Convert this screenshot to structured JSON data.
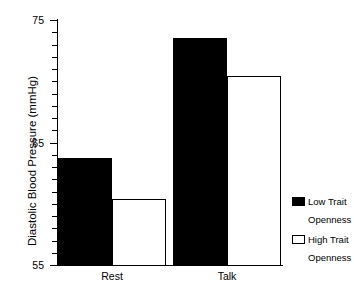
{
  "chart_data": {
    "type": "bar",
    "title": "",
    "xlabel": "",
    "ylabel": "Diastolic Blood Pressure (mmHg)",
    "categories": [
      "Rest",
      "Talk"
    ],
    "series": [
      {
        "name": "Low Trait Openness",
        "values": [
          63.7,
          73.5
        ],
        "color": "#000000"
      },
      {
        "name": "High Trait Openness",
        "values": [
          60.4,
          70.4
        ],
        "color": "#ffffff"
      }
    ],
    "ylim": [
      55,
      75
    ],
    "yticks": [
      55,
      65,
      75
    ],
    "ytick_labels": [
      "55",
      "65",
      "75"
    ],
    "yminor_interval": 1,
    "grid": false,
    "legend_position": "right"
  },
  "axes": {
    "y_title": "Diastolic Blood Pressure (mmHg)",
    "y_ticks": [
      {
        "value": 75,
        "label": "75",
        "major": true
      },
      {
        "value": 74,
        "label": "",
        "major": false
      },
      {
        "value": 73,
        "label": "",
        "major": false
      },
      {
        "value": 72,
        "label": "",
        "major": false
      },
      {
        "value": 71,
        "label": "",
        "major": false
      },
      {
        "value": 70,
        "label": "",
        "major": false
      },
      {
        "value": 69,
        "label": "",
        "major": false
      },
      {
        "value": 68,
        "label": "",
        "major": false
      },
      {
        "value": 67,
        "label": "",
        "major": false
      },
      {
        "value": 66,
        "label": "",
        "major": false
      },
      {
        "value": 65,
        "label": "65",
        "major": true
      },
      {
        "value": 64,
        "label": "",
        "major": false
      },
      {
        "value": 63,
        "label": "",
        "major": false
      },
      {
        "value": 62,
        "label": "",
        "major": false
      },
      {
        "value": 61,
        "label": "",
        "major": false
      },
      {
        "value": 60,
        "label": "",
        "major": false
      },
      {
        "value": 59,
        "label": "",
        "major": false
      },
      {
        "value": 58,
        "label": "",
        "major": false
      },
      {
        "value": 57,
        "label": "",
        "major": false
      },
      {
        "value": 56,
        "label": "",
        "major": false
      },
      {
        "value": 55,
        "label": "55",
        "major": true
      }
    ],
    "x_labels": [
      "Rest",
      "Talk"
    ]
  },
  "legend": {
    "entries": [
      {
        "swatch": "filled",
        "line1": "Low Trait",
        "line2": "Openness"
      },
      {
        "swatch": "hollow",
        "line1": "High Trait",
        "line2": "Openness"
      }
    ]
  }
}
